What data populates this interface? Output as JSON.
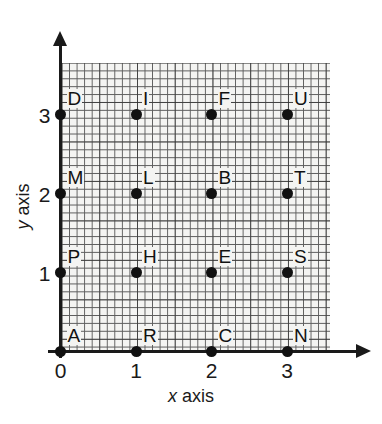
{
  "chart_data": {
    "type": "scatter",
    "title": "",
    "xlabel": "x axis",
    "ylabel": "y axis",
    "xlim": [
      0,
      3.5
    ],
    "ylim": [
      0,
      3.5
    ],
    "xticks": [
      "0",
      "1",
      "2",
      "3"
    ],
    "yticks": [
      "0",
      "1",
      "2",
      "3"
    ],
    "xtick_values": [
      0,
      1,
      2,
      3
    ],
    "ytick_values": [
      0,
      1,
      2,
      3
    ],
    "grid": true,
    "grid_style": "graph-paper",
    "legend": "none",
    "point_label_position": "above-right-of-point",
    "points": [
      {
        "label": "A",
        "x": 0,
        "y": 0
      },
      {
        "label": "R",
        "x": 1,
        "y": 0
      },
      {
        "label": "C",
        "x": 2,
        "y": 0
      },
      {
        "label": "N",
        "x": 3,
        "y": 0
      },
      {
        "label": "P",
        "x": 0,
        "y": 1
      },
      {
        "label": "H",
        "x": 1,
        "y": 1
      },
      {
        "label": "E",
        "x": 2,
        "y": 1
      },
      {
        "label": "S",
        "x": 3,
        "y": 1
      },
      {
        "label": "M",
        "x": 0,
        "y": 2
      },
      {
        "label": "L",
        "x": 1,
        "y": 2
      },
      {
        "label": "B",
        "x": 2,
        "y": 2
      },
      {
        "label": "T",
        "x": 3,
        "y": 2
      },
      {
        "label": "D",
        "x": 0,
        "y": 3
      },
      {
        "label": "I",
        "x": 1,
        "y": 3
      },
      {
        "label": "F",
        "x": 2,
        "y": 3
      },
      {
        "label": "U",
        "x": 3,
        "y": 3
      }
    ]
  },
  "axis_titles": {
    "x_variable": "x",
    "x_word": "axis",
    "y_variable": "y",
    "y_word": "axis"
  },
  "colors": {
    "ink": "#1a1a1a",
    "point": "#111111",
    "grid_minor": "#5d5d5d",
    "grid_major": "#282828",
    "paper": "#f4f4f2",
    "background": "#ffffff"
  }
}
